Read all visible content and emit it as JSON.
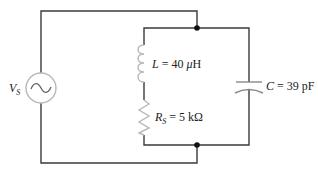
{
  "diagram": {
    "type": "circuit",
    "components": {
      "source": {
        "symbol": "V",
        "subscript": "S",
        "kind": "ac-voltage-source"
      },
      "inductor": {
        "symbol": "L",
        "eq": " = 40 ",
        "unit_prefix": "μ",
        "unit": "H",
        "value": "40 μH"
      },
      "resistor": {
        "symbol": "R",
        "subscript": "S",
        "eq": " = 5 kΩ",
        "value": "5 kΩ"
      },
      "capacitor": {
        "symbol": "C",
        "eq": " = 39 pF",
        "value": "39 pF"
      }
    },
    "colors": {
      "wire": "#3a3a3a",
      "component": "#b8b8b8",
      "node": "#111111"
    }
  }
}
